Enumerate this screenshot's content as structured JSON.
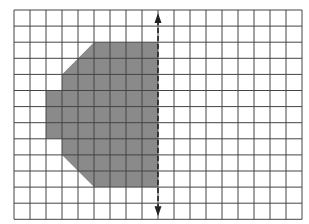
{
  "figure": {
    "grid": {
      "columns": 18,
      "rows": 13,
      "origin_x": 14,
      "origin_y": 10,
      "cell_w": 16,
      "cell_h": 16.1,
      "line_color": "#444444",
      "background": "#ffffff"
    },
    "shape": {
      "fill": "#8a8a8a",
      "vertices_cells": [
        [
          5,
          2
        ],
        [
          9,
          2
        ],
        [
          9,
          11
        ],
        [
          5,
          11
        ],
        [
          3,
          9
        ],
        [
          3,
          8
        ],
        [
          2,
          8
        ],
        [
          2,
          5
        ],
        [
          3,
          5
        ],
        [
          3,
          4
        ]
      ]
    },
    "symmetry_line": {
      "column": 9,
      "style": "dashed",
      "color": "#222222",
      "arrows": [
        "up",
        "down"
      ]
    }
  }
}
